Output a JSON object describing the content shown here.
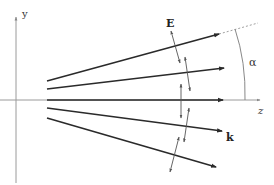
{
  "diagram": {
    "axes": {
      "y_label": "y",
      "z_label": "z"
    },
    "labels": {
      "field": "E",
      "wavevector": "k",
      "angle": "α"
    },
    "colors": {
      "axis": "#9a9a9a",
      "ray": "#2a2a2a",
      "polarization": "#555555",
      "dashed": "#a0a0a0",
      "background": "#ffffff"
    },
    "rays": [
      {
        "name": "ray-1",
        "x1": 47,
        "y1": 81,
        "x2": 219,
        "y2": 34
      },
      {
        "name": "ray-2",
        "x1": 47,
        "y1": 89,
        "x2": 224,
        "y2": 68
      },
      {
        "name": "ray-3",
        "x1": 47,
        "y1": 100,
        "x2": 223,
        "y2": 100
      },
      {
        "name": "ray-4",
        "x1": 47,
        "y1": 108,
        "x2": 222,
        "y2": 131
      },
      {
        "name": "ray-5",
        "x1": 47,
        "y1": 118,
        "x2": 216,
        "y2": 167
      }
    ],
    "polarization_vectors": [
      {
        "name": "E-vector-1",
        "x1": 171,
        "y1": 31,
        "x2": 180,
        "y2": 63
      },
      {
        "name": "E-vector-2",
        "x1": 185,
        "y1": 57,
        "x2": 190,
        "y2": 91
      },
      {
        "name": "E-vector-3",
        "x1": 181,
        "y1": 84,
        "x2": 181,
        "y2": 118
      },
      {
        "name": "E-vector-4",
        "x1": 189,
        "y1": 108,
        "x2": 184,
        "y2": 142
      },
      {
        "name": "E-vector-5",
        "x1": 179,
        "y1": 137,
        "x2": 170,
        "y2": 172
      }
    ]
  }
}
